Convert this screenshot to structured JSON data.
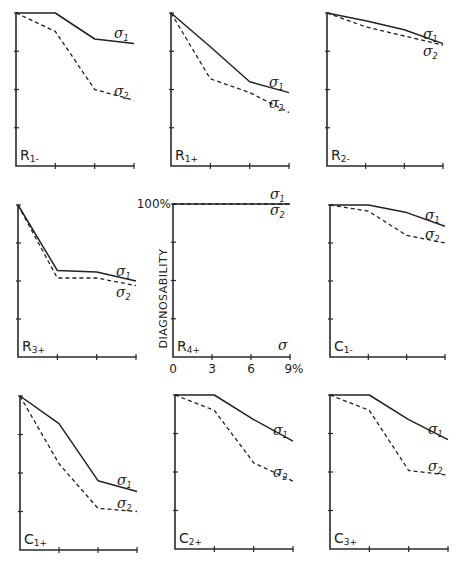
{
  "chart_data": {
    "type": "line",
    "layout": "3x3 small multiples",
    "ylabel": "DIAGNOSABILITY",
    "xlabel": "σ",
    "y_tick_top_label": "100%",
    "x_tick_labels": [
      "0",
      "3",
      "6",
      "9%"
    ],
    "x": [
      0,
      3,
      6,
      9
    ],
    "xlim": [
      0,
      9
    ],
    "ylim": [
      0,
      100
    ],
    "y_ticks": [
      25,
      50,
      75,
      100
    ],
    "grid": false,
    "series_names": [
      "σ1",
      "σ2"
    ],
    "series_styles": {
      "σ1": "solid",
      "σ2": "dashed"
    },
    "panels": [
      {
        "label": "R1-",
        "main": "R",
        "sub": "1-",
        "series": [
          {
            "name": "σ1",
            "values": [
              100,
              100,
              83,
              80
            ]
          },
          {
            "name": "σ2",
            "values": [
              100,
              88,
              50,
              43
            ]
          }
        ]
      },
      {
        "label": "R1+",
        "main": "R",
        "sub": "1+",
        "series": [
          {
            "name": "σ1",
            "values": [
              100,
              78,
              55,
              48
            ]
          },
          {
            "name": "σ2",
            "values": [
              100,
              57,
              48,
              35
            ]
          }
        ]
      },
      {
        "label": "R2-",
        "main": "R",
        "sub": "2-",
        "series": [
          {
            "name": "σ1",
            "values": [
              100,
              95,
              89,
              80
            ]
          },
          {
            "name": "σ2",
            "values": [
              100,
              91,
              85,
              79
            ]
          }
        ]
      },
      {
        "label": "R3+",
        "main": "R",
        "sub": "3+",
        "series": [
          {
            "name": "σ1",
            "values": [
              100,
              57,
              56,
              50
            ]
          },
          {
            "name": "σ2",
            "values": [
              100,
              52,
              52,
              47
            ]
          }
        ]
      },
      {
        "label": "R4+",
        "main": "R",
        "sub": "4+",
        "series": [
          {
            "name": "σ1",
            "values": [
              100,
              100,
              100,
              100
            ]
          },
          {
            "name": "σ2",
            "values": [
              100,
              100,
              100,
              100
            ]
          }
        ]
      },
      {
        "label": "C1-",
        "main": "C",
        "sub": "1-",
        "series": [
          {
            "name": "σ1",
            "values": [
              100,
              100,
              95,
              86
            ]
          },
          {
            "name": "σ2",
            "values": [
              100,
              96,
              80,
              75
            ]
          }
        ]
      },
      {
        "label": "C1+",
        "main": "C",
        "sub": "1+",
        "series": [
          {
            "name": "σ1",
            "values": [
              100,
              82,
              45,
              38
            ]
          },
          {
            "name": "σ2",
            "values": [
              100,
              56,
              27,
              25
            ]
          }
        ]
      },
      {
        "label": "C2+",
        "main": "C",
        "sub": "2+",
        "series": [
          {
            "name": "σ1",
            "values": [
              100,
              100,
              84,
              70
            ]
          },
          {
            "name": "σ2",
            "values": [
              100,
              90,
              56,
              44
            ]
          }
        ]
      },
      {
        "label": "C3+",
        "main": "C",
        "sub": "3+",
        "series": [
          {
            "name": "σ1",
            "values": [
              100,
              100,
              84,
              71
            ]
          },
          {
            "name": "σ2",
            "values": [
              100,
              90,
              51,
              48
            ]
          }
        ]
      }
    ]
  }
}
